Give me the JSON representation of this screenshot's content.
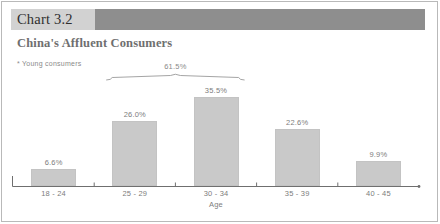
{
  "header": {
    "chart_number": "Chart 3.2",
    "title": "China's Affluent Consumers"
  },
  "note": "* Young consumers",
  "chart_data": {
    "type": "bar",
    "title": "China's Affluent Consumers",
    "xlabel": "Age",
    "ylabel": "",
    "categories": [
      "18 - 24",
      "25 - 29",
      "30 - 34",
      "35 - 39",
      "40 - 45"
    ],
    "values": [
      6.6,
      26.0,
      35.5,
      22.6,
      9.9
    ],
    "value_labels": [
      "6.6%",
      "26.0%",
      "35.5%",
      "22.6%",
      "9.9%"
    ],
    "ylim": [
      0,
      40
    ],
    "grid": false,
    "legend": null,
    "annotations": [
      {
        "text": "61.5%",
        "type": "brace",
        "spans_categories": [
          "25 - 29",
          "30 - 34"
        ],
        "value": 61.5
      },
      {
        "text": "* Young consumers",
        "type": "footnote"
      }
    ],
    "colors": {
      "bar_fill": "#c9c9c9",
      "axis": "#6f6f6f",
      "label_text": "#7d7d7d",
      "banner_dark": "#8e8e8e",
      "banner_light": "#d2d2d2"
    }
  }
}
